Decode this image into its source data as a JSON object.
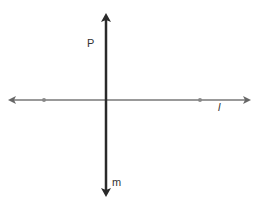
{
  "diagram": {
    "labels": {
      "point_p": "P",
      "line_l": "l",
      "line_m": "m"
    },
    "colors": {
      "line_m": "#2a2a2a",
      "line_l": "#777777",
      "points": "#888888",
      "text": "#333333"
    }
  }
}
